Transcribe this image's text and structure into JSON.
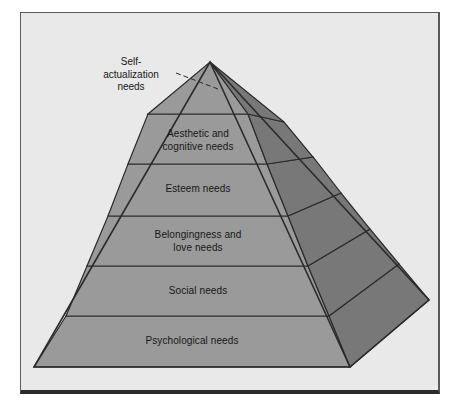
{
  "figure": {
    "background_color": "#e9e9e9",
    "frame_border_color": "#5a5a5a",
    "frame_bottom_color": "#2b2b2b",
    "front_face_color": "#9a9a9a",
    "side_face_color": "#787878",
    "outline_color": "#2b2b2b"
  },
  "callout": {
    "label": "Self-\nactualization\nneeds",
    "line_style": "dashed"
  },
  "tiers": [
    {
      "label": "Self-actualization needs",
      "position": 1,
      "rendered_inside": false
    },
    {
      "label": "Aesthetic and\ncognitive needs",
      "position": 2,
      "rendered_inside": true
    },
    {
      "label": "Esteem needs",
      "position": 3,
      "rendered_inside": true
    },
    {
      "label": "Belongingness and\nlove needs",
      "position": 4,
      "rendered_inside": true
    },
    {
      "label": "Social needs",
      "position": 5,
      "rendered_inside": true
    },
    {
      "label": "Psychological needs",
      "position": 6,
      "rendered_inside": true
    }
  ]
}
